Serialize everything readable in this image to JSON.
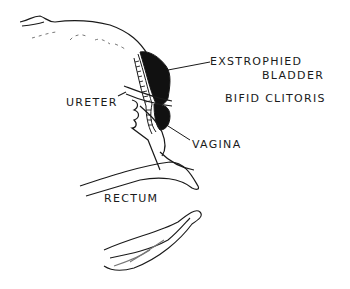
{
  "figure": {
    "type": "anatomical-line-drawing",
    "labels": {
      "exstrophied_bladder_line1": "EXSTROPHIED",
      "exstrophied_bladder_line2": "BLADDER",
      "bifid_clitoris": "BIFID CLITORIS",
      "ureter": "URETER",
      "vagina": "VAGINA",
      "rectum": "RECTUM"
    },
    "colors": {
      "ink": "#1a1a1a",
      "background": "#ffffff"
    }
  }
}
